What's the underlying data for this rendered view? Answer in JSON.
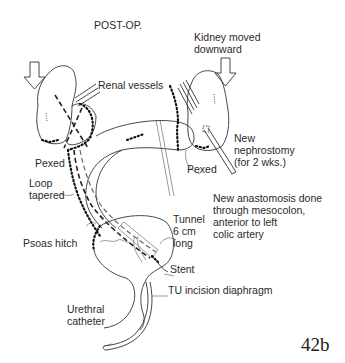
{
  "figure": {
    "title": "POST-OP.",
    "number": "42b"
  },
  "labels": {
    "kidney_moved": "Kidney moved\ndownward",
    "renal_vessels": "Renal vessels",
    "new_nephrostomy": "New\nnephrostomy\n(for 2 wks.)",
    "pexed_left": "Pexed",
    "pexed_right": "Pexed",
    "loop_tapered": "Loop\ntapered",
    "new_anastomosis": "New anastomosis done\nthrough mesocolon,\nanterior to left\ncolic artery",
    "tunnel": "Tunnel\n6 cm\nlong",
    "psoas_hitch": "Psoas hitch",
    "stent": "Stent",
    "tu_incision": "TU incision diaphragm",
    "urethral_catheter": "Urethral\ncatheter"
  },
  "colors": {
    "ink": "#333333",
    "background": "#ffffff"
  }
}
